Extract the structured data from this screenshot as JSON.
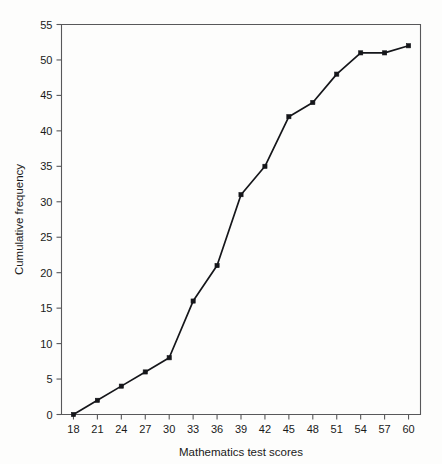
{
  "chart_data": {
    "type": "line",
    "title": "",
    "xlabel": "Mathematics test scores",
    "ylabel": "Cumulative frequency",
    "x": [
      18,
      21,
      24,
      27,
      30,
      33,
      36,
      39,
      42,
      45,
      48,
      51,
      54,
      57,
      60
    ],
    "values": [
      0,
      2,
      4,
      6,
      8,
      16,
      21,
      31,
      35,
      42,
      44,
      48,
      51,
      51,
      52
    ],
    "series": [
      {
        "name": "Cumulative frequency",
        "values": [
          0,
          2,
          4,
          6,
          8,
          16,
          21,
          31,
          35,
          42,
          44,
          48,
          51,
          51,
          52
        ]
      }
    ],
    "xticks": [
      "18",
      "21",
      "24",
      "27",
      "30",
      "33",
      "36",
      "39",
      "42",
      "45",
      "48",
      "51",
      "54",
      "57",
      "60"
    ],
    "yticks": [
      "0",
      "5",
      "10",
      "15",
      "20",
      "25",
      "30",
      "35",
      "40",
      "45",
      "50",
      "55"
    ],
    "xlim": [
      16.5,
      61.5
    ],
    "ylim": [
      0,
      55
    ],
    "grid": false,
    "legend": false,
    "marker": "filled-square",
    "line_color": "#15161a",
    "axis_color": "#58585a",
    "background_color": "#fdfdfc"
  }
}
